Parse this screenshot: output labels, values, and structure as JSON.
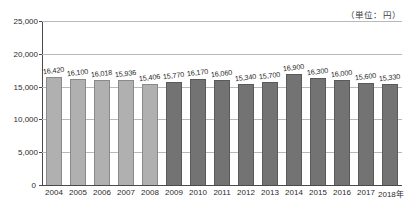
{
  "chart_data": {
    "type": "bar",
    "title": "",
    "subtitle": "",
    "unit_note": "（単位：円）",
    "xlabel": "",
    "ylabel": "",
    "ylim": [
      0,
      25000
    ],
    "ytick_step": 5000,
    "ytick_labels": [
      "0",
      "5,000",
      "10,000",
      "15,000",
      "20,000",
      "25,000"
    ],
    "ytick_values": [
      0,
      5000,
      10000,
      15000,
      20000,
      25000
    ],
    "grid": true,
    "legend": "none",
    "categories": [
      "2004",
      "2005",
      "2006",
      "2007",
      "2008",
      "2009",
      "2010",
      "2011",
      "2012",
      "2013",
      "2014",
      "2015",
      "2016",
      "2017",
      "2018年"
    ],
    "values": [
      16420,
      16100,
      16018,
      15936,
      15406,
      15770,
      16170,
      16060,
      15340,
      15700,
      16900,
      16300,
      16000,
      15600,
      15330
    ],
    "value_labels": [
      "16,420",
      "16,100",
      "16,018",
      "15,936",
      "15,406",
      "15,770",
      "16,170",
      "16,060",
      "15,340",
      "15,700",
      "16,900",
      "16,300",
      "16,000",
      "15,600",
      "15,330"
    ],
    "bar_styles": [
      "light",
      "light",
      "light",
      "light",
      "light",
      "dark",
      "dark",
      "dark",
      "dark",
      "dark",
      "dark",
      "dark",
      "dark",
      "dark",
      "dark"
    ],
    "colors": {
      "bar_light": "#b0b0b0",
      "bar_dark": "#737373",
      "bar_light_edge": "#8a8a8a",
      "bar_dark_edge": "#5a5a5a",
      "gridline": "#b9b9b9",
      "axis": "#4a4a4a",
      "text": "#2b2b2b",
      "background": "#ffffff"
    }
  }
}
